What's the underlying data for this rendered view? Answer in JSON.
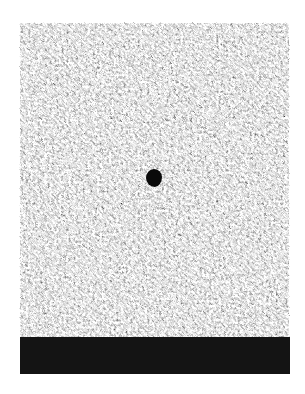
{
  "image": {
    "description": "Grayscale speckled noise texture field with a small dark blob near center and a solid black band along the bottom edge",
    "background_color": "#ffffff",
    "texture": {
      "tone_light": "#e8e8e8",
      "tone_dark": "#5a5a5a",
      "bounds": {
        "x": 19,
        "y": 22,
        "width": 271,
        "height": 318
      }
    },
    "blob": {
      "color": "#0a0a0a",
      "center": {
        "x": 154,
        "y": 178
      },
      "size": {
        "width": 16,
        "height": 18
      }
    },
    "band": {
      "color": "#141414",
      "bounds": {
        "x": 20,
        "y": 337,
        "width": 270,
        "height": 37
      }
    }
  }
}
